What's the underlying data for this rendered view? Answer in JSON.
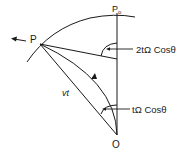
{
  "diagram": {
    "labels": {
      "p0": "P",
      "p0_sub": "o",
      "p": "P",
      "o": "O",
      "vt": "vt",
      "angle_top": "2tΩ Cosθ",
      "angle_bottom": "tΩ Cosθ"
    },
    "colors": {
      "stroke": "#1a1a1a",
      "background": "#ffffff"
    }
  }
}
